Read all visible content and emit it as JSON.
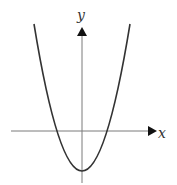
{
  "diagram": {
    "axes": {
      "x_label": "x",
      "y_label": "y",
      "axis_color": "#7a7a7a",
      "arrow_color": "#111111"
    },
    "curve": {
      "type": "parabola",
      "opens": "up",
      "vertex_position": "below x-axis, on y-axis",
      "x_intercepts": 2,
      "color": "#333333"
    }
  }
}
